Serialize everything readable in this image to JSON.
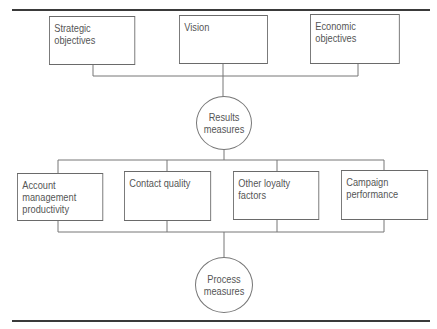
{
  "diagram": {
    "top_row": [
      {
        "label": "Strategic objectives"
      },
      {
        "label": "Vision"
      },
      {
        "label": "Economic objectives"
      }
    ],
    "results_node": {
      "line1": "Results",
      "line2": "measures"
    },
    "middle_row": [
      {
        "line1": "Account management",
        "line2": "productivity"
      },
      {
        "line1": "Contact quality",
        "line2": ""
      },
      {
        "line1": "Other loyalty factors",
        "line2": ""
      },
      {
        "line1": "Campaign",
        "line2": "performance"
      }
    ],
    "process_node": {
      "line1": "Process",
      "line2": "measures"
    }
  },
  "colors": {
    "rule": "#3a3a3a",
    "box_border": "#6a6a6a",
    "connector": "#777777",
    "text": "#555555"
  }
}
